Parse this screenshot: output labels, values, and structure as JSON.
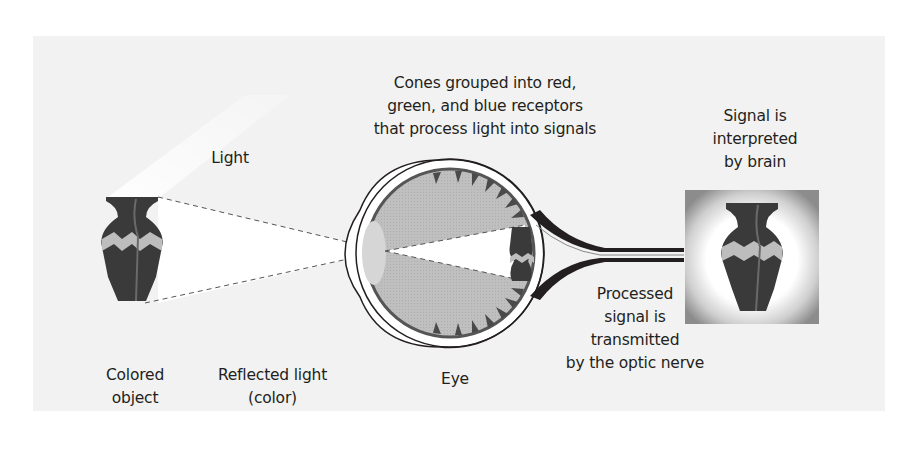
{
  "diagram": {
    "colors": {
      "panel_background": "#f2f2f2",
      "vase_dark": "#3a3a3a",
      "vase_band": "#bdbdbd",
      "eye_interior": "#bdbdbd",
      "cone_dark": "#4a4a4a",
      "lens": "#d6d6d6",
      "outline": "#231f20",
      "text": "#231f20"
    },
    "labels": {
      "light": [
        "Light"
      ],
      "cones": [
        "Cones grouped into red,",
        "green, and blue receptors",
        "that process light into signals"
      ],
      "brain": [
        "Signal is",
        "interpreted",
        "by brain"
      ],
      "colored_object": [
        "Colored",
        "object"
      ],
      "reflected_light": [
        "Reflected light",
        "(color)"
      ],
      "eye": [
        "Eye"
      ],
      "optic_nerve": [
        "Processed",
        "signal is",
        "transmitted",
        "by the optic nerve"
      ]
    }
  }
}
